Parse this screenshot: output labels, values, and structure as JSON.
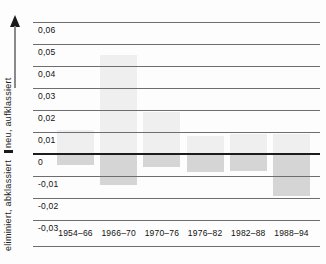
{
  "chart_data": {
    "type": "bar",
    "title": "",
    "categories": [
      "1954–66",
      "1966–70",
      "1970–76",
      "1976–82",
      "1982–88",
      "1988–94"
    ],
    "series": [
      {
        "name": "neu, aufklassiert",
        "values": [
          0.011,
          0.045,
          0.019,
          0.008,
          0.009,
          0.009
        ]
      },
      {
        "name": "eliminiert, abklassiert",
        "values": [
          -0.005,
          -0.014,
          -0.006,
          -0.008,
          -0.0075,
          -0.019
        ]
      }
    ],
    "yticks": [
      0.06,
      0.05,
      0.04,
      0.03,
      0.02,
      0.01,
      0,
      -0.01,
      -0.02,
      -0.03
    ],
    "ytick_labels": [
      "0,06",
      "0,05",
      "0,04",
      "0,03",
      "0,02",
      "0,01",
      "0",
      "-0,01",
      "-0,02",
      "-0,03"
    ],
    "ylim": [
      -0.03,
      0.065
    ],
    "xlabel": "",
    "ylabel": "eliminiert, abklassiert | neu, aufklassiert",
    "grid": true,
    "legend_position": "none",
    "colors": {
      "positive_bar": "#efefef",
      "negative_bar": "#d5d5d5",
      "gridline": "#6e6e6e",
      "zero_line": "#1c1c1c",
      "text": "#111111",
      "background": "#fdfdfd"
    }
  },
  "y_axis_label": {
    "top": "neu, aufklassiert",
    "bottom": "eliminiert, abklassiert"
  }
}
